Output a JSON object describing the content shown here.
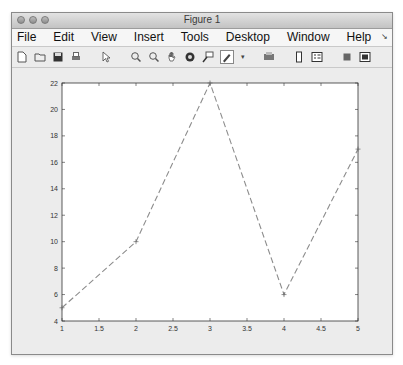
{
  "window": {
    "title": "Figure 1"
  },
  "menubar": {
    "items": [
      "File",
      "Edit",
      "View",
      "Insert",
      "Tools",
      "Desktop",
      "Window",
      "Help"
    ]
  },
  "toolbar": {
    "buttons": [
      {
        "name": "new-figure-icon"
      },
      {
        "name": "open-file-icon"
      },
      {
        "name": "save-icon"
      },
      {
        "name": "print-icon"
      },
      {
        "name": "edit-plot-cursor-icon"
      },
      {
        "name": "zoom-in-icon"
      },
      {
        "name": "zoom-out-icon"
      },
      {
        "name": "pan-hand-icon"
      },
      {
        "name": "rotate-3d-icon"
      },
      {
        "name": "data-cursor-icon"
      },
      {
        "name": "brush-icon"
      },
      {
        "name": "brush-dropdown-icon"
      },
      {
        "name": "link-plot-icon"
      },
      {
        "name": "insert-colorbar-icon"
      },
      {
        "name": "insert-legend-icon"
      },
      {
        "name": "hide-plot-tools-icon"
      },
      {
        "name": "show-plot-tools-icon"
      }
    ]
  },
  "chart_data": {
    "type": "line",
    "title": "",
    "xlabel": "",
    "ylabel": "",
    "x": [
      1,
      2,
      3,
      4,
      5
    ],
    "series": [
      {
        "name": "data1",
        "values": [
          5,
          10,
          22,
          6,
          17
        ],
        "line_style": "dashed",
        "marker": "+",
        "color": "#8c8c8c"
      }
    ],
    "xlim": [
      1,
      5
    ],
    "ylim": [
      4,
      22
    ],
    "xticks": [
      1,
      1.5,
      2,
      2.5,
      3,
      3.5,
      4,
      4.5,
      5
    ],
    "xtick_labels": [
      "1",
      "1.5",
      "2",
      "2.5",
      "3",
      "3.5",
      "4",
      "4.5",
      "5"
    ],
    "yticks": [
      4,
      6,
      8,
      10,
      12,
      14,
      16,
      18,
      20,
      22
    ],
    "ytick_labels": [
      "4",
      "6",
      "8",
      "10",
      "12",
      "14",
      "16",
      "18",
      "20",
      "22"
    ],
    "grid": false,
    "legend": null
  }
}
